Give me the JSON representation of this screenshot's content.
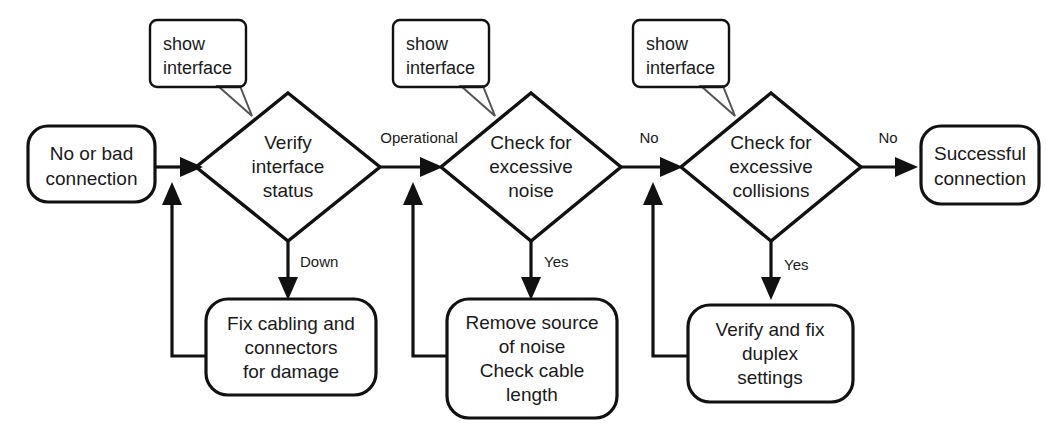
{
  "diagram": {
    "colors": {
      "decision_fill": "#c9c9c9",
      "process_fill": "#ffffff",
      "stroke": "#111111",
      "text": "#1a1a1a",
      "callout_stroke": "#333333"
    },
    "start_node": {
      "id": "start",
      "shape": "rounded-rect",
      "lines": [
        "No or bad",
        "connection"
      ]
    },
    "end_node": {
      "id": "end",
      "shape": "rounded-rect",
      "lines": [
        "Successful",
        "connection"
      ]
    },
    "decisions": [
      {
        "id": "verify-interface-status",
        "shape": "diamond",
        "lines": [
          "Verify",
          "interface",
          "status"
        ]
      },
      {
        "id": "check-excessive-noise",
        "shape": "diamond",
        "lines": [
          "Check for",
          "excessive",
          "noise"
        ]
      },
      {
        "id": "check-excessive-collisions",
        "shape": "diamond",
        "lines": [
          "Check for",
          "excessive",
          "collisions"
        ]
      }
    ],
    "remediations": [
      {
        "id": "fix-cabling",
        "shape": "rounded-rect",
        "lines": [
          "Fix cabling and",
          "connectors",
          "for damage"
        ]
      },
      {
        "id": "remove-noise",
        "shape": "rounded-rect",
        "lines": [
          "Remove source",
          "of noise",
          "Check cable",
          "length"
        ]
      },
      {
        "id": "fix-duplex",
        "shape": "rounded-rect",
        "lines": [
          "Verify and fix",
          "duplex",
          "settings"
        ]
      }
    ],
    "callouts": [
      {
        "id": "callout-1",
        "lines": [
          "show",
          "interface"
        ],
        "points_to": "verify-interface-status"
      },
      {
        "id": "callout-2",
        "lines": [
          "show",
          "interface"
        ],
        "points_to": "check-excessive-noise"
      },
      {
        "id": "callout-3",
        "lines": [
          "show",
          "interface"
        ],
        "points_to": "check-excessive-collisions"
      }
    ],
    "edge_labels": {
      "operational": "Operational",
      "down": "Down",
      "no_noise": "No",
      "yes_noise": "Yes",
      "no_collisions": "No",
      "yes_collisions": "Yes"
    }
  }
}
